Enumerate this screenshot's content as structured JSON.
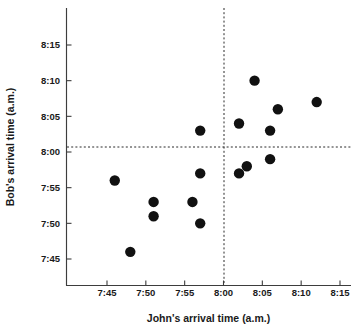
{
  "chart_data": {
    "type": "scatter",
    "title": "",
    "xlabel": "John's arrival time  (a.m.)",
    "ylabel": "Bob's arrival time  (a.m.)",
    "xticklabels": [
      "7:45",
      "7:50",
      "7:55",
      "8:00",
      "8:05",
      "8:10",
      "8:15"
    ],
    "yticklabels": [
      "7:45",
      "7:50",
      "7:55",
      "8:00",
      "8:05",
      "8:10",
      "8:15"
    ],
    "xtickvalues": [
      465,
      470,
      475,
      480,
      485,
      490,
      495
    ],
    "ytickvalues": [
      465,
      470,
      475,
      480,
      485,
      490,
      495
    ],
    "xlim": [
      462,
      498
    ],
    "ylim": [
      462,
      499
    ],
    "grid": false,
    "legend": null,
    "reference_lines": [
      {
        "orientation": "vertical",
        "x": "8:00",
        "style": "dashed"
      },
      {
        "orientation": "horizontal",
        "y": "8:00",
        "style": "dashed"
      }
    ],
    "marker": {
      "shape": "circle",
      "color": "#111111",
      "size": 5.2
    },
    "points": [
      {
        "x": "7:46",
        "y": "7:56",
        "xv": 466,
        "yv": 476
      },
      {
        "x": "7:48",
        "y": "7:46",
        "xv": 468,
        "yv": 466
      },
      {
        "x": "7:51",
        "y": "7:53",
        "xv": 471,
        "yv": 473
      },
      {
        "x": "7:51",
        "y": "7:51",
        "xv": 471,
        "yv": 471
      },
      {
        "x": "7:56",
        "y": "7:53",
        "xv": 476,
        "yv": 473
      },
      {
        "x": "7:57",
        "y": "7:57",
        "xv": 477,
        "yv": 477
      },
      {
        "x": "7:57",
        "y": "7:50",
        "xv": 477,
        "yv": 470
      },
      {
        "x": "7:57",
        "y": "8:03",
        "xv": 477,
        "yv": 483
      },
      {
        "x": "8:02",
        "y": "7:57",
        "xv": 482,
        "yv": 477
      },
      {
        "x": "8:02",
        "y": "8:04",
        "xv": 482,
        "yv": 484
      },
      {
        "x": "8:03",
        "y": "7:58",
        "xv": 483,
        "yv": 478
      },
      {
        "x": "8:04",
        "y": "8:10",
        "xv": 484,
        "yv": 490
      },
      {
        "x": "8:06",
        "y": "7:59",
        "xv": 486,
        "yv": 479
      },
      {
        "x": "8:06",
        "y": "8:03",
        "xv": 486,
        "yv": 483
      },
      {
        "x": "8:07",
        "y": "8:06",
        "xv": 487,
        "yv": 486
      },
      {
        "x": "8:12",
        "y": "8:07",
        "xv": 492,
        "yv": 487
      }
    ]
  }
}
